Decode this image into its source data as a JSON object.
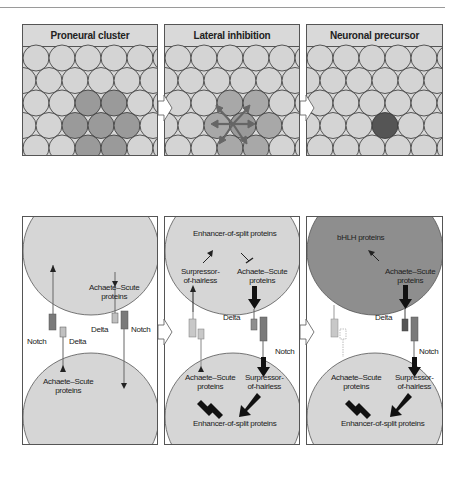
{
  "figure": {
    "panels": [
      {
        "id": "proneural",
        "title": "Proneural cluster"
      },
      {
        "id": "lateral",
        "title": "Lateral inhibition"
      },
      {
        "id": "precursor",
        "title": "Neuronal precursor"
      }
    ],
    "lower_panels": [
      {
        "id": "proneural-signaling",
        "labels": {
          "top_achaete": "Achaete–Scute\nproteins",
          "delta_top": "Delta",
          "notch_top": "Notch",
          "notch_bottom": "Notch",
          "delta_bottom": "Delta",
          "bottom_achaete": "Achaete–Scute\nproteins"
        }
      },
      {
        "id": "lateral-signaling",
        "labels": {
          "enhancer_top": "Enhancer-of-split proteins",
          "suppressor_top": "Surpressor-\nof-hairless",
          "achaete_top": "Achaete–Scute\nproteins",
          "delta": "Delta",
          "notch": "Notch",
          "achaete_bottom": "Achaete–Scute\nproteins",
          "suppressor_bottom": "Surpressor-\nof-hairless",
          "enhancer_bottom": "Enhancer-of-split proteins"
        }
      },
      {
        "id": "precursor-signaling",
        "labels": {
          "bhlh": "bHLH proteins",
          "achaete_top": "Achaete–Scute\nproteins",
          "delta": "Delta",
          "notch": "Notch",
          "achaete_bottom": "Achaete–Scute\nproteins",
          "suppressor_bottom": "Surpressor-\nof-hairless",
          "enhancer_bottom": "Enhancer-of-split proteins"
        }
      }
    ],
    "colors": {
      "cell_light": "#d4d4d4",
      "cell_cluster": "#9a9a9a",
      "cell_inhibit": "#a8a8a8",
      "cell_precursor": "#555555",
      "big_cell_light": "#d6d6d6",
      "big_cell_dark": "#8e8e8e",
      "notch": "#7a7a7a",
      "delta": "#c0c0c0"
    }
  }
}
